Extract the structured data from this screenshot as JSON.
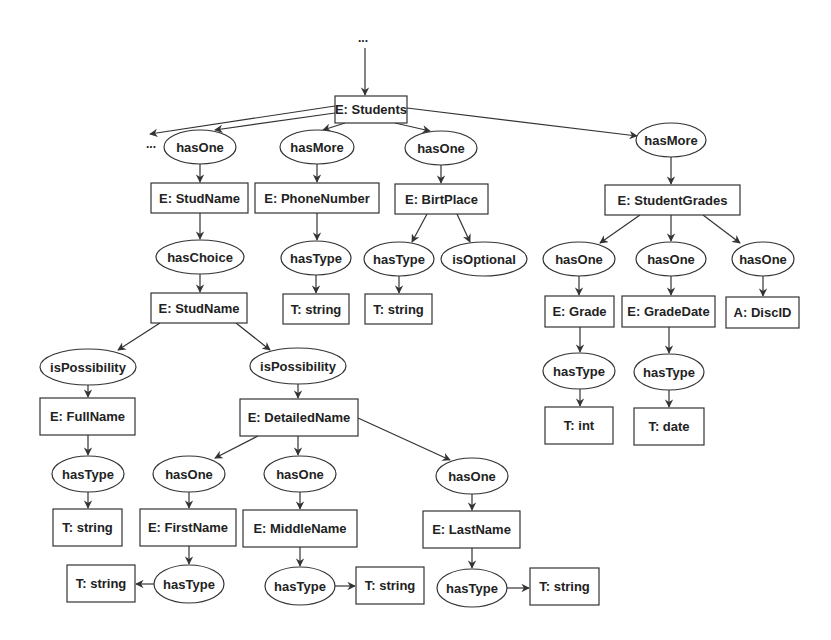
{
  "diagram": {
    "ellipsis_top": "...",
    "ellipsis_left": "...",
    "nodes": [
      {
        "id": "students",
        "kind": "box",
        "label": "E: Students",
        "x": 335,
        "y": 96,
        "w": 72,
        "h": 27
      },
      {
        "id": "hasone_1",
        "kind": "ellipse",
        "label": "hasOne",
        "cx": 200,
        "cy": 147,
        "rx": 36,
        "ry": 17
      },
      {
        "id": "hasmore_1",
        "kind": "ellipse",
        "label": "hasMore",
        "cx": 317,
        "cy": 147,
        "rx": 37,
        "ry": 17
      },
      {
        "id": "hasone_2",
        "kind": "ellipse",
        "label": "hasOne",
        "cx": 441,
        "cy": 148,
        "rx": 36,
        "ry": 17
      },
      {
        "id": "hasmore_2",
        "kind": "ellipse",
        "label": "hasMore",
        "cx": 671,
        "cy": 140,
        "rx": 35,
        "ry": 17
      },
      {
        "id": "studname_1",
        "kind": "box",
        "label": "E: StudName",
        "x": 151,
        "y": 183,
        "w": 97,
        "h": 30
      },
      {
        "id": "phonenumber",
        "kind": "box",
        "label": "E: PhoneNumber",
        "x": 255,
        "y": 183,
        "w": 124,
        "h": 30
      },
      {
        "id": "birtplace",
        "kind": "box",
        "label": "E: BirtPlace",
        "x": 395,
        "y": 184,
        "w": 93,
        "h": 30
      },
      {
        "id": "studentgrades",
        "kind": "box",
        "label": "E: StudentGrades",
        "x": 605,
        "y": 185,
        "w": 135,
        "h": 30
      },
      {
        "id": "haschoice",
        "kind": "ellipse",
        "label": "hasChoice",
        "cx": 200,
        "cy": 257,
        "rx": 44,
        "ry": 17
      },
      {
        "id": "hastype_phone",
        "kind": "ellipse",
        "label": "hasType",
        "cx": 316,
        "cy": 258,
        "rx": 35,
        "ry": 17
      },
      {
        "id": "hastype_birt",
        "kind": "ellipse",
        "label": "hasType",
        "cx": 399,
        "cy": 259,
        "rx": 35,
        "ry": 17
      },
      {
        "id": "isoptional",
        "kind": "ellipse",
        "label": "isOptional",
        "cx": 484,
        "cy": 259,
        "rx": 43,
        "ry": 17
      },
      {
        "id": "hasone_g1",
        "kind": "ellipse",
        "label": "hasOne",
        "cx": 579,
        "cy": 259,
        "rx": 36,
        "ry": 17
      },
      {
        "id": "hasone_g2",
        "kind": "ellipse",
        "label": "hasOne",
        "cx": 671,
        "cy": 259,
        "rx": 35,
        "ry": 17
      },
      {
        "id": "hasone_g3",
        "kind": "ellipse",
        "label": "hasOne",
        "cx": 763,
        "cy": 259,
        "rx": 31,
        "ry": 17
      },
      {
        "id": "studname_2",
        "kind": "box",
        "label": "E: StudName",
        "x": 151,
        "y": 293,
        "w": 96,
        "h": 30
      },
      {
        "id": "string_phone",
        "kind": "box",
        "label": "T: string",
        "x": 283,
        "y": 294,
        "w": 66,
        "h": 30
      },
      {
        "id": "string_birt",
        "kind": "box",
        "label": "T: string",
        "x": 365,
        "y": 294,
        "w": 67,
        "h": 30
      },
      {
        "id": "grade",
        "kind": "box",
        "label": "E: Grade",
        "x": 545,
        "y": 296,
        "w": 69,
        "h": 31
      },
      {
        "id": "gradedate",
        "kind": "box",
        "label": "E: GradeDate",
        "x": 622,
        "y": 296,
        "w": 93,
        "h": 31
      },
      {
        "id": "discid",
        "kind": "box",
        "label": "A: DiscID",
        "x": 726,
        "y": 297,
        "w": 73,
        "h": 31
      },
      {
        "id": "ispossibility_1",
        "kind": "ellipse",
        "label": "isPossibility",
        "cx": 88,
        "cy": 367,
        "rx": 48,
        "ry": 18
      },
      {
        "id": "ispossibility_2",
        "kind": "ellipse",
        "label": "isPossibility",
        "cx": 298,
        "cy": 366,
        "rx": 48,
        "ry": 18
      },
      {
        "id": "hastype_grade",
        "kind": "ellipse",
        "label": "hasType",
        "cx": 579,
        "cy": 371,
        "rx": 36,
        "ry": 18
      },
      {
        "id": "hastype_gradedate",
        "kind": "ellipse",
        "label": "hasType",
        "cx": 669,
        "cy": 372,
        "rx": 35,
        "ry": 18
      },
      {
        "id": "fullname",
        "kind": "box",
        "label": "E: FullName",
        "x": 40,
        "y": 398,
        "w": 95,
        "h": 37
      },
      {
        "id": "detailedname",
        "kind": "box",
        "label": "E: DetailedName",
        "x": 240,
        "y": 399,
        "w": 118,
        "h": 37
      },
      {
        "id": "int",
        "kind": "box",
        "label": "T: int",
        "x": 545,
        "y": 407,
        "w": 68,
        "h": 37
      },
      {
        "id": "date",
        "kind": "box",
        "label": "T: date",
        "x": 634,
        "y": 408,
        "w": 70,
        "h": 37
      },
      {
        "id": "hastype_full",
        "kind": "ellipse",
        "label": "hasType",
        "cx": 88,
        "cy": 474,
        "rx": 36,
        "ry": 18
      },
      {
        "id": "hasone_first",
        "kind": "ellipse",
        "label": "hasOne",
        "cx": 189,
        "cy": 474,
        "rx": 36,
        "ry": 18
      },
      {
        "id": "hasone_middle",
        "kind": "ellipse",
        "label": "hasOne",
        "cx": 300,
        "cy": 474,
        "rx": 36,
        "ry": 18
      },
      {
        "id": "hasone_last",
        "kind": "ellipse",
        "label": "hasOne",
        "cx": 472,
        "cy": 476,
        "rx": 36,
        "ry": 18
      },
      {
        "id": "string_full",
        "kind": "box",
        "label": "T: string",
        "x": 53,
        "y": 509,
        "w": 69,
        "h": 37
      },
      {
        "id": "firstname",
        "kind": "box",
        "label": "E: FirstName",
        "x": 140,
        "y": 509,
        "w": 96,
        "h": 37
      },
      {
        "id": "middlename",
        "kind": "box",
        "label": "E: MiddleName",
        "x": 243,
        "y": 510,
        "w": 114,
        "h": 37
      },
      {
        "id": "lastname",
        "kind": "box",
        "label": "E: LastName",
        "x": 423,
        "y": 511,
        "w": 97,
        "h": 37
      },
      {
        "id": "string_first",
        "kind": "box",
        "label": "T: string",
        "x": 67,
        "y": 565,
        "w": 68,
        "h": 37
      },
      {
        "id": "hastype_first",
        "kind": "ellipse",
        "label": "hasType",
        "cx": 189,
        "cy": 584,
        "rx": 35,
        "ry": 19
      },
      {
        "id": "hastype_middle",
        "kind": "ellipse",
        "label": "hasType",
        "cx": 300,
        "cy": 586,
        "rx": 35,
        "ry": 19
      },
      {
        "id": "string_middle",
        "kind": "box",
        "label": "T: string",
        "x": 356,
        "y": 567,
        "w": 68,
        "h": 37
      },
      {
        "id": "hastype_last",
        "kind": "ellipse",
        "label": "hasType",
        "cx": 472,
        "cy": 588,
        "rx": 35,
        "ry": 19
      },
      {
        "id": "string_last",
        "kind": "box",
        "label": "T: string",
        "x": 530,
        "y": 568,
        "w": 69,
        "h": 37
      }
    ],
    "edges": [
      {
        "x1": 365,
        "y1": 48,
        "x2": 365,
        "y2": 95
      },
      {
        "x1": 335,
        "y1": 106,
        "x2": 150,
        "y2": 134
      },
      {
        "x1": 335,
        "y1": 113,
        "x2": 215,
        "y2": 130
      },
      {
        "x1": 345,
        "y1": 123,
        "x2": 323,
        "y2": 130
      },
      {
        "x1": 395,
        "y1": 123,
        "x2": 430,
        "y2": 131
      },
      {
        "x1": 407,
        "y1": 108,
        "x2": 637,
        "y2": 136
      },
      {
        "x1": 200,
        "y1": 164,
        "x2": 200,
        "y2": 182
      },
      {
        "x1": 317,
        "y1": 164,
        "x2": 317,
        "y2": 182
      },
      {
        "x1": 441,
        "y1": 165,
        "x2": 441,
        "y2": 183
      },
      {
        "x1": 671,
        "y1": 157,
        "x2": 671,
        "y2": 184
      },
      {
        "x1": 200,
        "y1": 213,
        "x2": 200,
        "y2": 239
      },
      {
        "x1": 317,
        "y1": 213,
        "x2": 317,
        "y2": 240
      },
      {
        "x1": 427,
        "y1": 214,
        "x2": 412,
        "y2": 242
      },
      {
        "x1": 457,
        "y1": 214,
        "x2": 470,
        "y2": 242
      },
      {
        "x1": 640,
        "y1": 215,
        "x2": 600,
        "y2": 243
      },
      {
        "x1": 671,
        "y1": 215,
        "x2": 671,
        "y2": 241
      },
      {
        "x1": 703,
        "y1": 215,
        "x2": 740,
        "y2": 243
      },
      {
        "x1": 200,
        "y1": 274,
        "x2": 200,
        "y2": 292
      },
      {
        "x1": 316,
        "y1": 275,
        "x2": 316,
        "y2": 293
      },
      {
        "x1": 399,
        "y1": 276,
        "x2": 399,
        "y2": 293
      },
      {
        "x1": 579,
        "y1": 276,
        "x2": 579,
        "y2": 295
      },
      {
        "x1": 671,
        "y1": 276,
        "x2": 671,
        "y2": 295
      },
      {
        "x1": 763,
        "y1": 276,
        "x2": 763,
        "y2": 296
      },
      {
        "x1": 160,
        "y1": 323,
        "x2": 118,
        "y2": 350
      },
      {
        "x1": 236,
        "y1": 323,
        "x2": 270,
        "y2": 350
      },
      {
        "x1": 580,
        "y1": 327,
        "x2": 580,
        "y2": 352
      },
      {
        "x1": 669,
        "y1": 327,
        "x2": 669,
        "y2": 353
      },
      {
        "x1": 88,
        "y1": 385,
        "x2": 88,
        "y2": 397
      },
      {
        "x1": 298,
        "y1": 384,
        "x2": 298,
        "y2": 398
      },
      {
        "x1": 580,
        "y1": 389,
        "x2": 580,
        "y2": 406
      },
      {
        "x1": 669,
        "y1": 390,
        "x2": 669,
        "y2": 407
      },
      {
        "x1": 88,
        "y1": 435,
        "x2": 88,
        "y2": 455
      },
      {
        "x1": 258,
        "y1": 436,
        "x2": 215,
        "y2": 458
      },
      {
        "x1": 298,
        "y1": 436,
        "x2": 298,
        "y2": 455
      },
      {
        "x1": 358,
        "y1": 418,
        "x2": 450,
        "y2": 460
      },
      {
        "x1": 88,
        "y1": 492,
        "x2": 88,
        "y2": 508
      },
      {
        "x1": 189,
        "y1": 492,
        "x2": 189,
        "y2": 508
      },
      {
        "x1": 300,
        "y1": 492,
        "x2": 300,
        "y2": 509
      },
      {
        "x1": 472,
        "y1": 494,
        "x2": 472,
        "y2": 510
      },
      {
        "x1": 189,
        "y1": 546,
        "x2": 189,
        "y2": 564
      },
      {
        "x1": 300,
        "y1": 547,
        "x2": 300,
        "y2": 566
      },
      {
        "x1": 472,
        "y1": 548,
        "x2": 472,
        "y2": 568
      },
      {
        "x1": 154,
        "y1": 584,
        "x2": 136,
        "y2": 584
      },
      {
        "x1": 335,
        "y1": 586,
        "x2": 355,
        "y2": 586
      },
      {
        "x1": 507,
        "y1": 588,
        "x2": 529,
        "y2": 588
      }
    ]
  }
}
